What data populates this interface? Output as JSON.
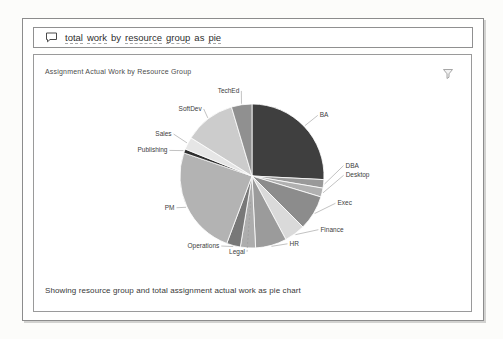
{
  "search": {
    "query": "total work by resource group as pie",
    "query_words": [
      {
        "text": "total",
        "underline": true
      },
      {
        "text": "work",
        "underline": true
      },
      {
        "text": "by",
        "underline": false
      },
      {
        "text": "resource",
        "underline": true
      },
      {
        "text": "group",
        "underline": true
      },
      {
        "text": "as",
        "underline": false
      },
      {
        "text": "pie",
        "underline": true
      }
    ],
    "icon": "speech-bubble-icon"
  },
  "card": {
    "title": "Assignment Actual Work by Resource Group",
    "filter_icon": "filter-funnel-icon",
    "status_text": "Showing resource group and total assignment actual work as pie chart"
  },
  "chart_data": {
    "type": "pie",
    "title": "Assignment Actual Work by Resource Group",
    "categories": [
      "BA",
      "DBA",
      "Desktop",
      "Exec",
      "Finance",
      "HR",
      "Legal",
      "Operations",
      "PM",
      "Publishing",
      "Sales",
      "SoftDev",
      "TechEd"
    ],
    "values": [
      25.8,
      1.9,
      2.0,
      7.8,
      4.7,
      7.0,
      3.4,
      3.1,
      24.5,
      0.9,
      2.8,
      11.5,
      4.6
    ],
    "value_unit": "percent of total (estimated from slice angles, no data labels shown)",
    "colors": [
      "#3f3f3f",
      "#999999",
      "#b0b0b0",
      "#8c8c8c",
      "#dadada",
      "#9b9b9b",
      "#adadad",
      "#787878",
      "#b3b3b3",
      "#2e2e2e",
      "#e6e6e6",
      "#cccccc",
      "#909090"
    ],
    "start_angle_deg": 0,
    "direction": "clockwise",
    "order": "alphabetical",
    "legend": "none",
    "labels": "outside with leader lines",
    "slice_stroke": "#ffffff"
  }
}
